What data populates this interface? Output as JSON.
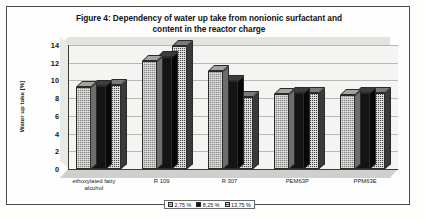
{
  "figure": {
    "title_line1": "Figure 4: Dependency of water up take from nonionic surfactant and",
    "title_line2": "content in the reactor charge"
  },
  "chart_data": {
    "type": "bar",
    "title": "Figure 4: Dependency of water up take from nonionic surfactant and content in the reactor charge",
    "xlabel": "",
    "ylabel": "Water up take [%]",
    "ylim": [
      0,
      14
    ],
    "yticks": [
      0,
      2,
      4,
      6,
      8,
      10,
      12,
      14
    ],
    "ytick_labels": [
      "0",
      "2",
      "4",
      "6",
      "8",
      "10",
      "12",
      "14"
    ],
    "grid": true,
    "legend_position": "bottom",
    "style": "3d-column",
    "categories": [
      "ethoxylated fatty alcohol",
      "R 109",
      "R 307",
      "PEM63P",
      "PPM63E"
    ],
    "category_lines": [
      [
        "ethoxylated fatty",
        "alcohol"
      ],
      [
        "R 109"
      ],
      [
        "R 307"
      ],
      [
        "PEM63P"
      ],
      [
        "PPM63E"
      ]
    ],
    "series": [
      {
        "name": "2,75 %",
        "fill": "gray-dotted",
        "color": "#8a8a88",
        "values": [
          9.3,
          12.2,
          11.1,
          8.5,
          8.4
        ]
      },
      {
        "name": "8,25 %",
        "fill": "solid-black",
        "color": "#141414",
        "values": [
          9.4,
          12.6,
          9.9,
          8.6,
          8.6
        ]
      },
      {
        "name": "13,75 %",
        "fill": "checkered",
        "color": "#4d4d4d",
        "values": [
          9.5,
          13.9,
          8.1,
          8.6,
          8.6
        ]
      }
    ]
  }
}
